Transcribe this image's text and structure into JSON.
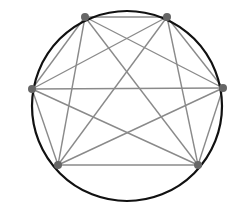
{
  "diagram": {
    "type": "complete-graph-on-circle",
    "name": "K6",
    "circle": {
      "cx": 127,
      "cy": 106,
      "r": 95,
      "stroke": "#111111",
      "stroke_width": 2.2
    },
    "nodes": [
      {
        "id": "n1",
        "x": 85,
        "y": 17
      },
      {
        "id": "n2",
        "x": 167,
        "y": 17
      },
      {
        "id": "n3",
        "x": 223,
        "y": 88
      },
      {
        "id": "n4",
        "x": 198,
        "y": 165
      },
      {
        "id": "n5",
        "x": 58,
        "y": 165
      },
      {
        "id": "n6",
        "x": 32,
        "y": 89
      }
    ],
    "node_style": {
      "r": 4,
      "fill": "#666666"
    },
    "edge_style": {
      "stroke": "#8a8a8a",
      "stroke_width": 1.4
    },
    "edges": [
      [
        "n1",
        "n2"
      ],
      [
        "n1",
        "n3"
      ],
      [
        "n1",
        "n4"
      ],
      [
        "n1",
        "n5"
      ],
      [
        "n1",
        "n6"
      ],
      [
        "n2",
        "n3"
      ],
      [
        "n2",
        "n4"
      ],
      [
        "n2",
        "n5"
      ],
      [
        "n2",
        "n6"
      ],
      [
        "n3",
        "n4"
      ],
      [
        "n3",
        "n5"
      ],
      [
        "n3",
        "n6"
      ],
      [
        "n4",
        "n5"
      ],
      [
        "n4",
        "n6"
      ],
      [
        "n5",
        "n6"
      ]
    ]
  }
}
